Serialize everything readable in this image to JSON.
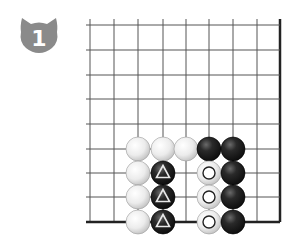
{
  "problem": {
    "number": "1",
    "badge_shape": "cat-head",
    "badge_color": "#8a8a8a",
    "badge_text_color": "#ffffff"
  },
  "board": {
    "columns_x": [
      90,
      114,
      138,
      163,
      186,
      209,
      233,
      257,
      280
    ],
    "rows_y": [
      25,
      50,
      75,
      99,
      124,
      149,
      173,
      197,
      222
    ],
    "right_edge": true,
    "bottom_edge": true,
    "line_color": "#555555",
    "edge_color": "#222222",
    "stone_radius": 12
  },
  "stones": [
    {
      "color": "white",
      "col": 2,
      "row": 5
    },
    {
      "color": "white",
      "col": 3,
      "row": 5
    },
    {
      "color": "white",
      "col": 4,
      "row": 5
    },
    {
      "color": "black",
      "col": 5,
      "row": 5
    },
    {
      "color": "black",
      "col": 6,
      "row": 5
    },
    {
      "color": "white",
      "col": 2,
      "row": 6
    },
    {
      "color": "black",
      "col": 3,
      "row": 6,
      "mark": "triangle"
    },
    {
      "color": "white",
      "col": 5,
      "row": 6,
      "mark": "circle"
    },
    {
      "color": "black",
      "col": 6,
      "row": 6
    },
    {
      "color": "white",
      "col": 2,
      "row": 7
    },
    {
      "color": "black",
      "col": 3,
      "row": 7,
      "mark": "triangle"
    },
    {
      "color": "white",
      "col": 5,
      "row": 7,
      "mark": "circle"
    },
    {
      "color": "black",
      "col": 6,
      "row": 7
    },
    {
      "color": "white",
      "col": 2,
      "row": 8
    },
    {
      "color": "black",
      "col": 3,
      "row": 8,
      "mark": "triangle"
    },
    {
      "color": "white",
      "col": 5,
      "row": 8,
      "mark": "circle"
    },
    {
      "color": "black",
      "col": 6,
      "row": 8
    }
  ]
}
